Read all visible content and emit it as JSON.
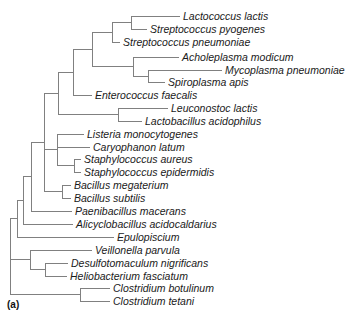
{
  "figure": {
    "panel_label": "(a)",
    "type": "phylogenetic-tree",
    "orientation": "left-to-right",
    "line_color": "#808080",
    "text_color": "#1a1a1a",
    "background": "#ffffff"
  },
  "chart_data": {
    "type": "tree",
    "title": "",
    "xlabel": "",
    "ylabel": "",
    "leaf_count": 22,
    "leaves": [
      {
        "index": 0,
        "label": "Lactococcus lactis",
        "row_y": 16,
        "branch_x": 180,
        "label_x": 183
      },
      {
        "index": 1,
        "label": "Streptococcus pyogenes",
        "row_y": 29,
        "branch_x": 147,
        "label_x": 150
      },
      {
        "index": 2,
        "label": "Streptococcus pneumoniae",
        "row_y": 42,
        "branch_x": 120,
        "label_x": 123
      },
      {
        "index": 3,
        "label": "Acholeplasma modicum",
        "row_y": 57,
        "branch_x": 179,
        "label_x": 182
      },
      {
        "index": 4,
        "label": "Mycoplasma pneumoniae",
        "row_y": 70,
        "branch_x": 222,
        "label_x": 225
      },
      {
        "index": 5,
        "label": "Spiroplasma apis",
        "row_y": 82,
        "branch_x": 165,
        "label_x": 168
      },
      {
        "index": 6,
        "label": "Enterococcus faecalis",
        "row_y": 95,
        "branch_x": 92,
        "label_x": 95
      },
      {
        "index": 7,
        "label": "Leuconostoc lactis",
        "row_y": 108,
        "branch_x": 168,
        "label_x": 171
      },
      {
        "index": 8,
        "label": "Lactobacillus acidophilus",
        "row_y": 121,
        "branch_x": 142,
        "label_x": 145
      },
      {
        "index": 9,
        "label": "Listeria monocytogenes",
        "row_y": 134,
        "branch_x": 84,
        "label_x": 87
      },
      {
        "index": 10,
        "label": "Caryophanon latum",
        "row_y": 147,
        "branch_x": 90,
        "label_x": 93
      },
      {
        "index": 11,
        "label": "Staphylococcus aureus",
        "row_y": 159,
        "branch_x": 81,
        "label_x": 84
      },
      {
        "index": 12,
        "label": "Staphylococcus epidermidis",
        "row_y": 172,
        "branch_x": 81,
        "label_x": 84
      },
      {
        "index": 13,
        "label": "Bacillus megaterium",
        "row_y": 185,
        "branch_x": 71,
        "label_x": 74
      },
      {
        "index": 14,
        "label": "Bacillus subtilis",
        "row_y": 198,
        "branch_x": 71,
        "label_x": 74
      },
      {
        "index": 15,
        "label": "Paenibacillus macerans",
        "row_y": 211,
        "branch_x": 72,
        "label_x": 75
      },
      {
        "index": 16,
        "label": "Alicyclobacillus acidocaldarius",
        "row_y": 224,
        "branch_x": 73,
        "label_x": 76
      },
      {
        "index": 17,
        "label": "Epulopiscium",
        "row_y": 237,
        "branch_x": 114,
        "label_x": 117
      },
      {
        "index": 18,
        "label": "Veillonella parvula",
        "row_y": 250,
        "branch_x": 92,
        "label_x": 95
      },
      {
        "index": 19,
        "label": "Desulfotomaculum nigrificans",
        "row_y": 263,
        "branch_x": 68,
        "label_x": 71
      },
      {
        "index": 20,
        "label": "Heliobacterium fasciatum",
        "row_y": 276,
        "branch_x": 67,
        "label_x": 70
      },
      {
        "index": 21,
        "label": "Clostridium botulinum",
        "row_y": 288,
        "branch_x": 110,
        "label_x": 113
      },
      {
        "index": 22,
        "label": "Clostridium tetani",
        "row_y": 301,
        "branch_x": 110,
        "label_x": 113
      }
    ],
    "internal_nodes": [
      {
        "name": "lactococcus-streptococcus-pyogenes",
        "x": 131,
        "y_top": 16,
        "y_bottom": 29,
        "parent_x": 112
      },
      {
        "name": "streptococcaceae",
        "x": 112,
        "y_top": 22,
        "y_bottom": 42,
        "parent_x": 92
      },
      {
        "name": "acholeplasma-mollicutes-sister",
        "x": 133,
        "y_top": 57,
        "y_bottom": 76,
        "parent_x": 115
      },
      {
        "name": "mycoplasma-spiroplasma",
        "x": 148,
        "y_top": 70,
        "y_bottom": 82,
        "parent_x": 133
      },
      {
        "name": "mollicutes",
        "x": 115,
        "y_top": 57,
        "y_bottom": 76,
        "parent_x": 92
      },
      {
        "name": "strep-mollicutes-clade",
        "x": 92,
        "y_top": 32,
        "y_bottom": 66,
        "parent_x": 73
      },
      {
        "name": "with-enterococcus",
        "x": 73,
        "y_top": 49,
        "y_bottom": 95,
        "parent_x": 58
      },
      {
        "name": "leuconostoc-lactobacillus",
        "x": 118,
        "y_top": 108,
        "y_bottom": 121,
        "parent_x": 58
      },
      {
        "name": "lactobacillales-clade",
        "x": 58,
        "y_top": 72,
        "y_bottom": 114,
        "parent_x": 44
      },
      {
        "name": "staphylococcus",
        "x": 74,
        "y_top": 159,
        "y_bottom": 172,
        "parent_x": 57
      },
      {
        "name": "listeria-caryophanon-staph",
        "x": 57,
        "y_top": 134,
        "y_bottom": 165,
        "parent_x": 44
      },
      {
        "name": "listeria-caryophanon-join",
        "x": 57,
        "y_top": 134,
        "y_bottom": 147,
        "parent_x": 57
      },
      {
        "name": "bacillus",
        "x": 62,
        "y_top": 185,
        "y_bottom": 198,
        "parent_x": 44
      },
      {
        "name": "bacillales-upper",
        "x": 44,
        "y_top": 93,
        "y_bottom": 191,
        "parent_x": 31
      },
      {
        "name": "with-paenibacillus",
        "x": 31,
        "y_top": 142,
        "y_bottom": 211,
        "parent_x": 23
      },
      {
        "name": "with-alicyclobacillus",
        "x": 23,
        "y_top": 176,
        "y_bottom": 224,
        "parent_x": 17
      },
      {
        "name": "with-epulopiscium",
        "x": 17,
        "y_top": 200,
        "y_bottom": 237,
        "parent_x": 10
      },
      {
        "name": "desulfoto-helio",
        "x": 45,
        "y_top": 263,
        "y_bottom": 276,
        "parent_x": 30
      },
      {
        "name": "veillonella-clade",
        "x": 30,
        "y_top": 250,
        "y_bottom": 269,
        "parent_x": 10
      },
      {
        "name": "clostridium",
        "x": 80,
        "y_top": 288,
        "y_bottom": 301,
        "parent_x": 10
      },
      {
        "name": "root",
        "x": 10,
        "y_top": 218,
        "y_bottom": 294,
        "parent_x": 10
      }
    ]
  }
}
